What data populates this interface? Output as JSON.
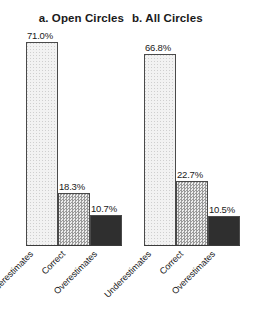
{
  "chart_data": [
    {
      "type": "bar",
      "title": "a. Open Circles",
      "panel_id": "a",
      "categories": [
        "Underestimates",
        "Correct",
        "Overestimates"
      ],
      "values": [
        71.0,
        18.3,
        10.7
      ],
      "value_labels": [
        "71.0%",
        "18.3%",
        "10.7%"
      ],
      "series": [
        {
          "name": "Open Circles",
          "values": [
            71.0,
            18.3,
            10.7
          ]
        }
      ],
      "xlabel": "",
      "ylabel": "",
      "ylim": [
        0,
        75
      ],
      "grid": false,
      "legend": "none",
      "bar_fills": [
        "light-dotted",
        "medium-checkered",
        "dark-solid"
      ],
      "bar_colors": [
        "#f2f2f2",
        "#bdbdbd",
        "#2f2f2f"
      ],
      "bar_border_color": "#4a4a4a"
    },
    {
      "type": "bar",
      "title": "b. All Circles",
      "panel_id": "b",
      "categories": [
        "Underestimates",
        "Correct",
        "Overestimates"
      ],
      "values": [
        66.8,
        22.7,
        10.5
      ],
      "value_labels": [
        "66.8%",
        "22.7%",
        "10.5%"
      ],
      "series": [
        {
          "name": "All Circles",
          "values": [
            66.8,
            22.7,
            10.5
          ]
        }
      ],
      "xlabel": "",
      "ylabel": "",
      "ylim": [
        0,
        75
      ],
      "grid": false,
      "legend": "none",
      "bar_fills": [
        "light-dotted",
        "medium-checkered",
        "dark-solid"
      ],
      "bar_colors": [
        "#f2f2f2",
        "#bdbdbd",
        "#2f2f2f"
      ],
      "bar_border_color": "#4a4a4a"
    }
  ]
}
